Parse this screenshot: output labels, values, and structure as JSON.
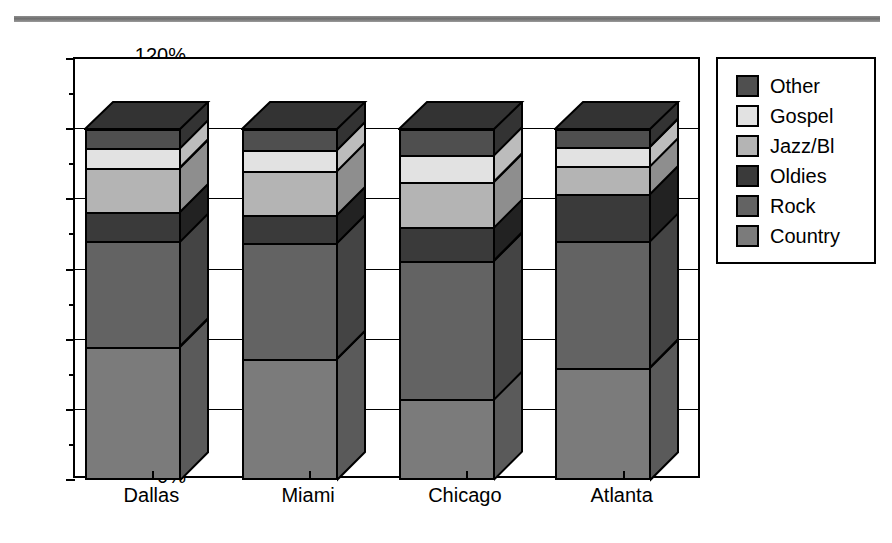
{
  "chart_data": {
    "type": "bar",
    "subtype": "stacked-3d-column",
    "title": "",
    "xlabel": "",
    "ylabel": "",
    "ylim": [
      0,
      120
    ],
    "ytick_labels": [
      "0%",
      "20%",
      "40%",
      "60%",
      "80%",
      "100%",
      "120%"
    ],
    "ytick_values": [
      0,
      20,
      40,
      60,
      80,
      100,
      120
    ],
    "minor_ticks": [
      10,
      30,
      50,
      70,
      90,
      110
    ],
    "grid": true,
    "legend_position": "right",
    "categories": [
      "Dallas",
      "Miami",
      "Chicago",
      "Atlanta"
    ],
    "series": [
      {
        "name": "Country",
        "color": "#7b7b7b",
        "side_color": "#5a5a5a",
        "values": [
          38,
          34.5,
          23,
          32
        ]
      },
      {
        "name": "Rock",
        "color": "#636363",
        "side_color": "#444444",
        "values": [
          30,
          33,
          39.5,
          36
        ]
      },
      {
        "name": "Oldies",
        "color": "#3a3a3a",
        "side_color": "#222222",
        "values": [
          8.5,
          8,
          9.5,
          13.5
        ]
      },
      {
        "name": "Jazz/Bl",
        "color": "#b4b4b4",
        "side_color": "#8e8e8e",
        "values": [
          12.5,
          12.5,
          13,
          8
        ]
      },
      {
        "name": "Gospel",
        "color": "#e2e2e2",
        "side_color": "#bcbcbc",
        "values": [
          5.5,
          6,
          7.5,
          5.5
        ]
      },
      {
        "name": "Other",
        "color": "#4f4f4f",
        "side_color": "#333333",
        "values": [
          5.5,
          6,
          7.5,
          5
        ]
      }
    ],
    "legend_entries": [
      {
        "label": "Other",
        "color": "#4f4f4f"
      },
      {
        "label": "Gospel",
        "color": "#e2e2e2"
      },
      {
        "label": "Jazz/Bl",
        "color": "#b4b4b4"
      },
      {
        "label": "Oldies",
        "color": "#3a3a3a"
      },
      {
        "label": "Rock",
        "color": "#636363"
      },
      {
        "label": "Country",
        "color": "#7b7b7b"
      }
    ]
  }
}
